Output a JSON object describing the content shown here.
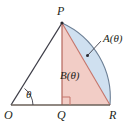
{
  "figure": {
    "background_color": "#ffffff",
    "stroke_color": "#3c3c46",
    "labels": {
      "vertex_P": "P",
      "vertex_O": "O",
      "vertex_Q": "Q",
      "vertex_R": "R",
      "region_A": "A(θ)",
      "region_B": "B(θ)",
      "angle_theta": "θ"
    },
    "colors": {
      "sector_fill": "#cfe0f0",
      "sector_stroke": "#6c7f95",
      "triangle_fill": "#f2cdc6",
      "triangle_stroke": "#c4746a",
      "line_stroke": "#3c3c46",
      "label_color": "#231f20",
      "axis_stroke": "#6b6158"
    },
    "geometry": {
      "point_O": [
        11,
        105
      ],
      "point_P": [
        62,
        23
      ],
      "point_Q": [
        62,
        105
      ],
      "point_R": [
        110,
        105
      ],
      "arc_center": [
        62,
        105
      ],
      "arc_radius": 48,
      "right_angle_marker_size": 8,
      "leader_line_from": [
        101,
        41
      ],
      "leader_line_to": [
        88,
        55
      ],
      "leader_dot": [
        88,
        55
      ]
    }
  }
}
